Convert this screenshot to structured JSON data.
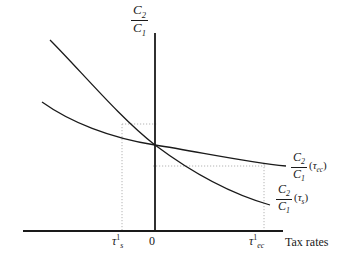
{
  "figure": {
    "type": "line-diagram",
    "background": "#ffffff",
    "ink_color": "#1a1a1a",
    "guide_color": "#b4b4b4"
  },
  "axes": {
    "y_axis": {
      "title_numerator": "C",
      "title_numerator_sub": "2",
      "title_denominator": "C",
      "title_denominator_sub": "1",
      "x_px": 155,
      "top_px": 33,
      "bottom_px": 231
    },
    "x_axis": {
      "title": "Tax rates",
      "y_px": 231,
      "left_px": 23,
      "right_px": 283
    },
    "origin_label": "0"
  },
  "ticks": [
    {
      "name": "tau-s-1",
      "symbol": "τ",
      "subscript": "s",
      "superscript": "1",
      "x_px": 122
    },
    {
      "name": "tau-ec-1",
      "symbol": "τ",
      "subscript": "ec",
      "superscript": "1",
      "x_px": 264
    }
  ],
  "curves": [
    {
      "name": "curve-tau-ec",
      "label_numerator": "C",
      "label_numerator_sub": "2",
      "label_denominator": "C",
      "label_denominator_sub": "1",
      "argument_open": "(",
      "argument_symbol": "τ",
      "argument_sub": "ec",
      "argument_close": ")",
      "description": "flatter convex decreasing curve",
      "path": "M 42,102 C 70,122 110,138 155,145 C 200,152 245,162 286,166",
      "stroke": "#1a1a1a",
      "stroke_width": 1.3
    },
    {
      "name": "curve-tau-s",
      "label_numerator": "C",
      "label_numerator_sub": "2",
      "label_denominator": "C",
      "label_denominator_sub": "1",
      "argument_open": "(",
      "argument_symbol": "τ",
      "argument_sub": "s",
      "argument_close": ")",
      "description": "steeper convex decreasing curve",
      "path": "M 50,40 C 80,70 120,118 155,145 C 195,175 235,195 270,205",
      "stroke": "#1a1a1a",
      "stroke_width": 1.3
    }
  ],
  "guides": [
    {
      "name": "guide-horizontal-upper",
      "orientation": "horizontal",
      "x1": 122,
      "y1": 124,
      "x2": 157,
      "y2": 124
    },
    {
      "name": "guide-vertical-tau-s",
      "orientation": "vertical",
      "x1": 122,
      "y1": 124,
      "x2": 122,
      "y2": 231
    },
    {
      "name": "guide-horizontal-lower",
      "orientation": "horizontal",
      "x1": 153,
      "y1": 166,
      "x2": 266,
      "y2": 166
    },
    {
      "name": "guide-vertical-tau-ec",
      "orientation": "vertical",
      "x1": 264,
      "y1": 164,
      "x2": 264,
      "y2": 231
    }
  ]
}
